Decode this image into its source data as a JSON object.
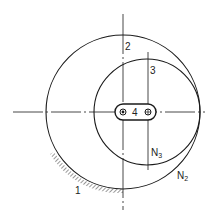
{
  "diagram": {
    "labels": {
      "ground": "1",
      "link2": "2",
      "link3": "3",
      "link4": "4",
      "n3": "N",
      "n3_sub": "3",
      "n2": "N",
      "n2_sub": "2"
    },
    "colors": {
      "stroke": "#1a1a1a",
      "background": "#ffffff"
    }
  }
}
